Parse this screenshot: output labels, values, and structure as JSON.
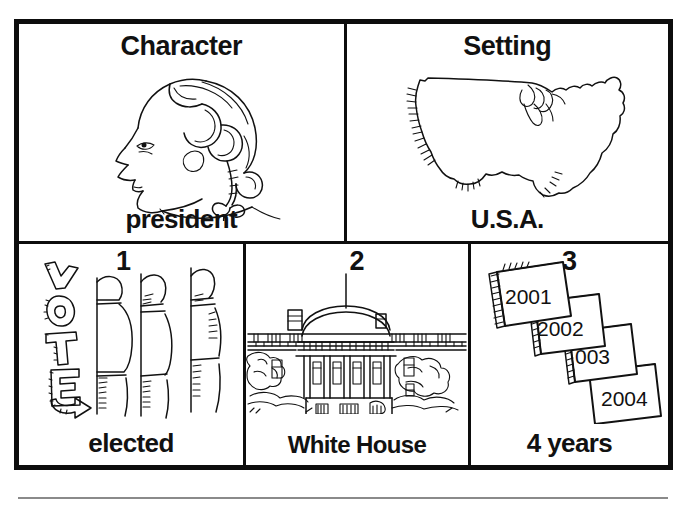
{
  "worksheet": {
    "title_implied": "Story elements organizer",
    "panels": [
      {
        "id": "character",
        "heading": "Character",
        "caption": "president",
        "illustration": "george-washington-profile-portrait"
      },
      {
        "id": "setting",
        "heading": "Setting",
        "caption": "U.S.A.",
        "illustration": "united-states-map-outline"
      },
      {
        "id": "elected",
        "number": "1",
        "caption": "elected",
        "sign_text": "VOTE",
        "illustration": "voting-booths-with-vote-sign"
      },
      {
        "id": "white-house",
        "number": "2",
        "caption": "White House",
        "illustration": "white-house-building"
      },
      {
        "id": "four-years",
        "number": "3",
        "caption": "4 years",
        "illustration": "stacked-calendar-pages",
        "calendar_years": [
          "2001",
          "2002",
          "003",
          "2004"
        ]
      }
    ]
  },
  "colors": {
    "ink": "#111111",
    "paper": "#ffffff",
    "rule": "#8a8a8a"
  }
}
